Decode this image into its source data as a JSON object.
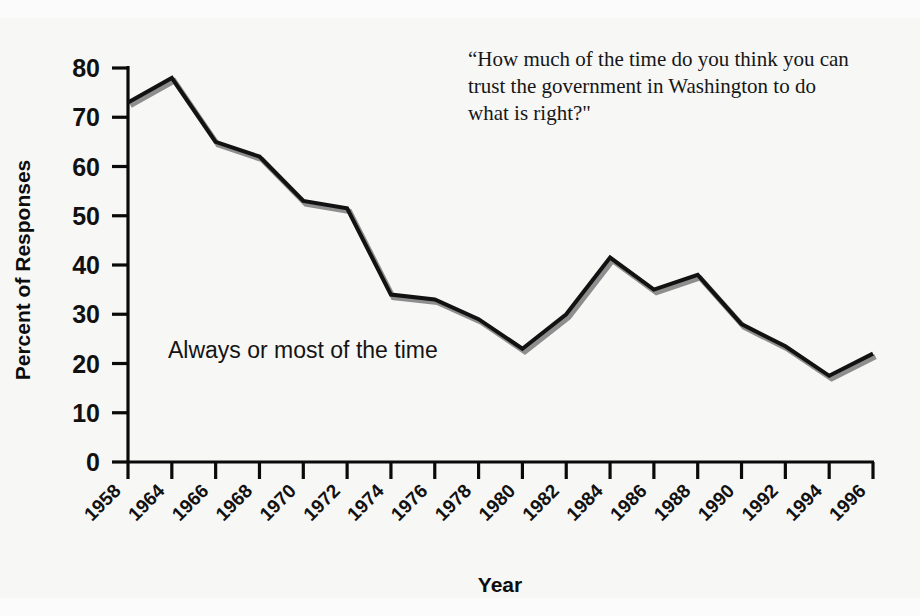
{
  "chart_data": {
    "type": "line",
    "title": "",
    "question_quote": "“How much of the time do you think you can trust the government in Washington to do what is right?\"",
    "xlabel": "Year",
    "ylabel": "Percent of Responses",
    "series_annotation": "Always or most of the time",
    "categories": [
      "1958",
      "1964",
      "1966",
      "1968",
      "1970",
      "1972",
      "1974",
      "1976",
      "1978",
      "1980",
      "1982",
      "1984",
      "1986",
      "1988",
      "1990",
      "1992",
      "1994",
      "1996"
    ],
    "x": [
      1958,
      1964,
      1966,
      1968,
      1970,
      1972,
      1974,
      1976,
      1978,
      1980,
      1982,
      1984,
      1986,
      1988,
      1990,
      1992,
      1994,
      1996
    ],
    "series": [
      {
        "name": "Always or most of the time",
        "values": [
          73,
          78,
          65,
          62,
          53,
          51.5,
          34,
          33,
          29,
          23,
          30,
          41.5,
          35,
          38,
          28,
          23.5,
          17.5,
          22
        ]
      }
    ],
    "ylim": [
      0,
      80
    ],
    "yticks": [
      "0",
      "10",
      "20",
      "30",
      "40",
      "50",
      "60",
      "70",
      "80"
    ],
    "grid": false,
    "legend": "none",
    "legend_position": "inline-annotation",
    "line_color": "#121212",
    "shadow_color": "#8e8e8e",
    "background_color": "#f7f7f6"
  },
  "axis": {
    "x_label": "Year",
    "y_label": "Percent of Responses"
  }
}
